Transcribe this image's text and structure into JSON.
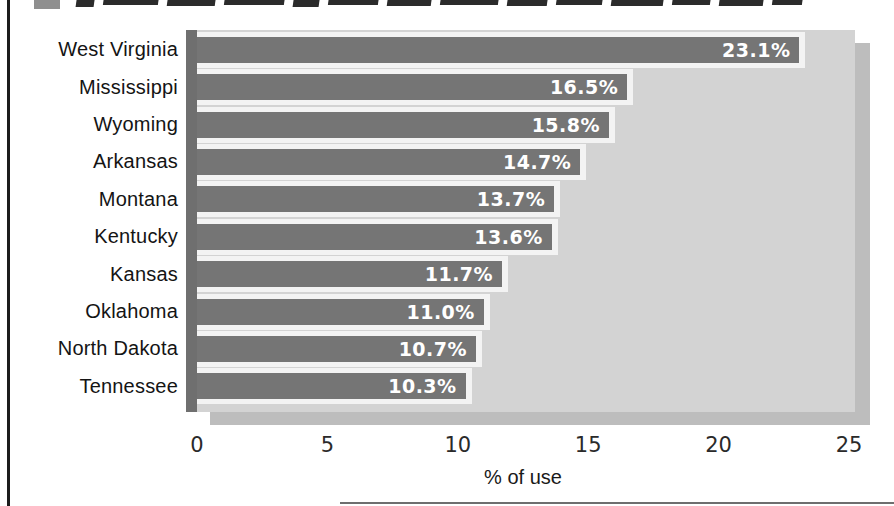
{
  "figure": {
    "title_clipped": true,
    "legend_marker_color": "#8f8f8f"
  },
  "chart_data": {
    "type": "bar",
    "orientation": "horizontal",
    "title": "",
    "categories": [
      "West Virginia",
      "Mississippi",
      "Wyoming",
      "Arkansas",
      "Montana",
      "Kentucky",
      "Kansas",
      "Oklahoma",
      "North Dakota",
      "Tennessee"
    ],
    "values": [
      23.1,
      16.5,
      15.8,
      14.7,
      13.7,
      13.6,
      11.7,
      11.0,
      10.7,
      10.3
    ],
    "value_labels": [
      "23.1%",
      "16.5%",
      "15.8%",
      "14.7%",
      "13.7%",
      "13.6%",
      "11.7%",
      "11.0%",
      "10.7%",
      "10.3%"
    ],
    "xlabel": "% of use",
    "x_ticks": [
      "0",
      "5",
      "10",
      "15",
      "20",
      "25"
    ],
    "xlim": [
      0,
      25
    ],
    "grid": false,
    "legend": false,
    "bar_color": "#757575",
    "plot_background": "#d3d3d3",
    "shadow_color": "#bdbdbd",
    "bar_outline_color": "#f3f3f3"
  }
}
